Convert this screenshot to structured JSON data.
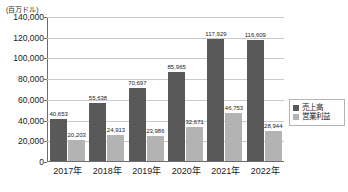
{
  "chart_data": {
    "type": "bar",
    "title": "",
    "unit_caption": "(百万ドル)",
    "xlabel": "",
    "ylabel": "",
    "ylim": [
      0,
      140000
    ],
    "grid": true,
    "legend_position": "right",
    "categories": [
      "2017年",
      "2018年",
      "2019年",
      "2020年",
      "2021年",
      "2022年"
    ],
    "y_ticks": [
      "0",
      "20,000",
      "40,000",
      "60,000",
      "80,000",
      "100,000",
      "120,000",
      "140,000"
    ],
    "y_tick_values": [
      0,
      20000,
      40000,
      60000,
      80000,
      100000,
      120000,
      140000
    ],
    "series": [
      {
        "name": "売上高",
        "color": "#595959",
        "values": [
          40653,
          55638,
          70697,
          85965,
          117929,
          116609
        ],
        "labels": [
          "40,653",
          "55,638",
          "70,697",
          "85,965",
          "117,929",
          "116,609"
        ]
      },
      {
        "name": "営業利益",
        "color": "#b3b3b3",
        "values": [
          20203,
          24913,
          23986,
          32671,
          46753,
          28944
        ],
        "labels": [
          "20,203",
          "24,913",
          "23,986",
          "32,671",
          "46,753",
          "28,944"
        ]
      }
    ]
  }
}
